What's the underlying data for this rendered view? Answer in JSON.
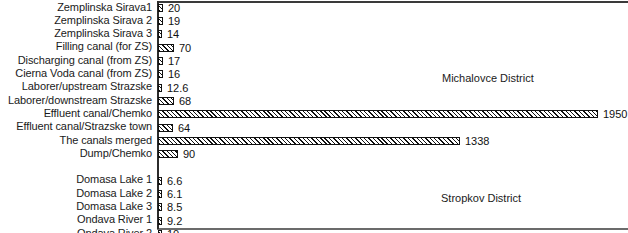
{
  "chart_data": {
    "type": "bar",
    "orientation": "horizontal",
    "title": "",
    "xlabel": "",
    "ylabel": "",
    "grid": false,
    "axis_ticks": [],
    "xlim": [
      0,
      2090
    ],
    "categories": [
      "Zemplinska Sirava1",
      "Zemplinska Sirava 2",
      "Zemplinska Sirava 3",
      "Filling canal (for ZS)",
      "Discharging canal (from ZS)",
      "Cierna Voda canal (from ZS)",
      "Laborer/upstream Strazske",
      "Laborer/downstream Strazske",
      "Effluent canal/Chemko",
      "Effluent canal/Strazske town",
      "The canals merged",
      "Dump/Chemko",
      "Domasa Lake 1",
      "Domasa Lake 2",
      "Domasa Lake 3",
      "Ondava River 1",
      "Ondava River 2"
    ],
    "values": [
      20,
      19,
      14,
      70,
      17,
      16,
      12.6,
      68,
      1950,
      64,
      1338,
      90,
      6.6,
      6.1,
      8.5,
      9.2,
      10
    ],
    "value_labels": [
      "20",
      "19",
      "14",
      "70",
      "17",
      "16",
      "12.6",
      "68",
      "1950",
      "64",
      "1338",
      "90",
      "6.6",
      "6.1",
      "8.5",
      "9.2",
      "10"
    ],
    "annotations": [
      {
        "text": "Michalovce District",
        "group": "upper"
      },
      {
        "text": "Stropkov District",
        "group": "lower"
      }
    ],
    "group_break_after_index": 11,
    "bar_style": {
      "fill": "diagonal-hatch",
      "hatch_color": "#111111",
      "background": "#ffffff",
      "border": "#111111"
    }
  },
  "rows": [
    {
      "label": "Zemplinska Sirava1",
      "value_label": "20",
      "bar_px": 5,
      "group": "upper"
    },
    {
      "label": "Zemplinska Sirava 2",
      "value_label": "19",
      "bar_px": 5,
      "group": "upper"
    },
    {
      "label": "Zemplinska Sirava 3",
      "value_label": "14",
      "bar_px": 4,
      "group": "upper"
    },
    {
      "label": "Filling canal (for ZS)",
      "value_label": "70",
      "bar_px": 16,
      "group": "upper"
    },
    {
      "label": "Discharging canal (from ZS)",
      "value_label": "17",
      "bar_px": 5,
      "group": "upper"
    },
    {
      "label": "Cierna Voda canal (from ZS)",
      "value_label": "16",
      "bar_px": 5,
      "group": "upper"
    },
    {
      "label": "Laborer/upstream Strazske",
      "value_label": "12.6",
      "bar_px": 4,
      "group": "upper"
    },
    {
      "label": "Laborer/downstream Strazske",
      "value_label": "68",
      "bar_px": 16,
      "group": "upper"
    },
    {
      "label": "Effluent canal/Chemko",
      "value_label": "1950",
      "bar_px": 440,
      "group": "upper"
    },
    {
      "label": "Effluent canal/Strazske town",
      "value_label": "64",
      "bar_px": 15,
      "group": "upper"
    },
    {
      "label": "The canals merged",
      "value_label": "1338",
      "bar_px": 302,
      "group": "upper"
    },
    {
      "label": "Dump/Chemko",
      "value_label": "90",
      "bar_px": 20,
      "group": "upper"
    },
    {
      "label": "",
      "value_label": "",
      "bar_px": 0,
      "group": "gap"
    },
    {
      "label": "Domasa Lake 1",
      "value_label": "6.6",
      "bar_px": 4,
      "group": "lower"
    },
    {
      "label": "Domasa Lake 2",
      "value_label": "6.1",
      "bar_px": 4,
      "group": "lower"
    },
    {
      "label": "Domasa Lake 3",
      "value_label": "8.5",
      "bar_px": 4,
      "group": "lower"
    },
    {
      "label": "Ondava River 1",
      "value_label": "9.2",
      "bar_px": 4,
      "group": "lower"
    },
    {
      "label": "Ondava River 2",
      "value_label": "10",
      "bar_px": 4,
      "group": "lower"
    }
  ],
  "notes": {
    "michalovce": "Michalovce District",
    "stropkov": "Stropkov District"
  }
}
